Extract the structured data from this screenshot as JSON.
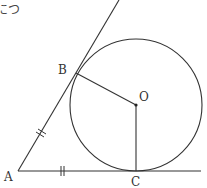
{
  "caption_fragment": "につ",
  "diagram": {
    "type": "geometry",
    "points": {
      "A": {
        "label": "A",
        "x": 18,
        "y": 171
      },
      "B": {
        "label": "B",
        "x": 76,
        "y": 73
      },
      "O": {
        "label": "O",
        "x": 136,
        "y": 105
      },
      "C": {
        "label": "C",
        "x": 136,
        "y": 171
      }
    },
    "circle": {
      "center": "O",
      "radius": 66
    },
    "segments": [
      {
        "from": "A",
        "to": "B",
        "extended": true,
        "tick_marks": 2
      },
      {
        "from": "A",
        "to": "C",
        "extended": true,
        "tick_marks": 2
      },
      {
        "from": "O",
        "to": "B"
      },
      {
        "from": "O",
        "to": "C"
      }
    ],
    "colors": {
      "stroke": "#333333",
      "background": "#ffffff"
    }
  }
}
